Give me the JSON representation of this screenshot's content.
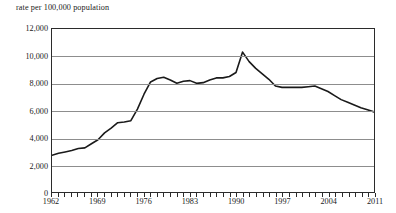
{
  "chart_data": {
    "type": "line",
    "title": "",
    "axis_note": "rate per 100,000 population",
    "xlabel": "",
    "ylabel": "rate per 100,000 population",
    "xlim": [
      1962,
      2011
    ],
    "ylim": [
      0,
      12000
    ],
    "ytick_values": [
      12000,
      10000,
      8000,
      6000,
      4000,
      2000,
      0
    ],
    "ytick_labels": [
      "12,000",
      "10,000",
      "8,000",
      "6,000",
      "4,000",
      "2,000",
      "0"
    ],
    "xtick_labels": [
      "1962",
      "1969",
      "1976",
      "1983",
      "1990",
      "1997",
      "2004",
      "2011"
    ],
    "xtick_values": [
      1962,
      1969,
      1976,
      1983,
      1990,
      1997,
      2004,
      2011
    ],
    "xtick_step_minor": 1,
    "grid": "horizontal",
    "legend": "none",
    "line_color": "#1a1a1a",
    "grid_color": "#8d8d8d",
    "axis_color": "#2b2b2b",
    "x": [
      1962,
      1963,
      1964,
      1965,
      1966,
      1967,
      1968,
      1969,
      1970,
      1971,
      1972,
      1973,
      1974,
      1975,
      1976,
      1977,
      1978,
      1979,
      1980,
      1981,
      1982,
      1983,
      1984,
      1985,
      1986,
      1987,
      1988,
      1989,
      1990,
      1991,
      1992,
      1993,
      1994,
      1995,
      1996,
      1997,
      1998,
      1999,
      2000,
      2001,
      2002,
      2003,
      2004,
      2005,
      2006,
      2007,
      2008,
      2009,
      2010,
      2011
    ],
    "values": [
      2700,
      2850,
      2950,
      3050,
      3200,
      3250,
      3550,
      3850,
      4350,
      4700,
      5100,
      5150,
      5250,
      6100,
      7200,
      8100,
      8350,
      8450,
      8250,
      8000,
      8150,
      8200,
      8000,
      8050,
      8250,
      8400,
      8400,
      8500,
      8800,
      10300,
      9600,
      9100,
      8700,
      8300,
      7800,
      7700,
      7700,
      7700,
      7700,
      7750,
      7800,
      7600,
      7400,
      7100,
      6800,
      6600,
      6400,
      6200,
      6050,
      5900
    ]
  },
  "figure": {
    "footnote": ""
  }
}
